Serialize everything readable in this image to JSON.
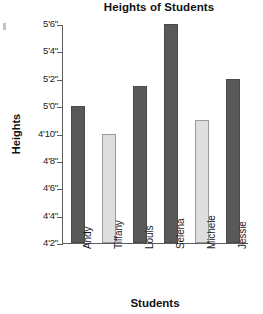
{
  "chart_data": {
    "type": "bar",
    "title": "Heights of Students",
    "xlabel": "Students",
    "ylabel": "Heights",
    "categories": [
      "Andy",
      "Tiffany",
      "Louis",
      "Selena",
      "Michele",
      "Jessie"
    ],
    "values": [
      60,
      58,
      61.5,
      66,
      59,
      62
    ],
    "value_labels": [
      "5'0\"",
      "4'10\"",
      "5'1\"",
      "5'6\"",
      "4'11\"",
      "5'2\""
    ],
    "bar_styles": [
      "dark",
      "light",
      "dark",
      "dark",
      "light",
      "dark"
    ],
    "ylim": [
      50,
      66
    ],
    "ytick_values": [
      66,
      64,
      62,
      60,
      58,
      56,
      54,
      52,
      50
    ],
    "ytick_labels": [
      "5'6\"",
      "5'4\"",
      "5'2\"",
      "5'0\"",
      "4'10\"",
      "4'8\"",
      "4'6\"",
      "4'4\"",
      "4'2\""
    ],
    "grid": false,
    "legend": null,
    "units": "feet-inches",
    "colors": {
      "bar_dark": "#595959",
      "bar_light": "#dedede",
      "bar_light_border": "#9a9a9a",
      "axis": "#5d5d5d",
      "text": "#1a1a1a"
    }
  }
}
